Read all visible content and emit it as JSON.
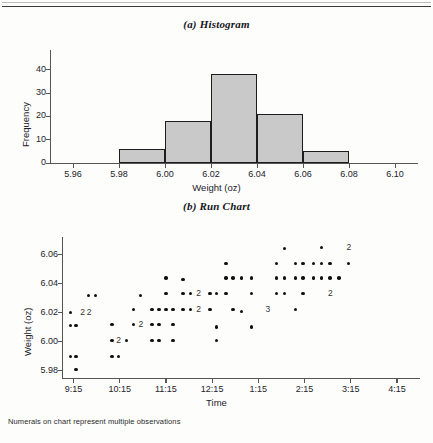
{
  "figure": {
    "title_a": "(a) Histogram",
    "title_b": "(b) Run Chart",
    "footnote": "Numerals on chart represent multiple observations"
  },
  "chart_data": [
    {
      "type": "bar",
      "title": "(a) Histogram",
      "xlabel": "Weight (oz)",
      "ylabel": "Frequency",
      "xlim": [
        5.95,
        6.11
      ],
      "ylim": [
        0,
        45
      ],
      "xticks": [
        "5.96",
        "5.98",
        "6.00",
        "6.02",
        "6.04",
        "6.06",
        "6.08",
        "6.10"
      ],
      "xtick_values": [
        5.96,
        5.98,
        6.0,
        6.02,
        6.04,
        6.06,
        6.08,
        6.1
      ],
      "yticks": [
        "0",
        "10",
        "20",
        "30",
        "40"
      ],
      "ytick_values": [
        0,
        10,
        20,
        30,
        40
      ],
      "grid": false,
      "legend": "none",
      "bin_edges": [
        5.98,
        6.0,
        6.02,
        6.04,
        6.06,
        6.08
      ],
      "categories": [
        "5.98-6.00",
        "6.00-6.02",
        "6.02-6.04",
        "6.04-6.06",
        "6.06-6.08"
      ],
      "values": [
        6,
        18,
        38,
        21,
        5
      ],
      "bar_fill": "#c9c9c9",
      "bar_edge": "#1d1d1d"
    },
    {
      "type": "scatter",
      "title": "(b) Run Chart",
      "xlabel": "Time",
      "ylabel": "Weight (oz)",
      "ylim": [
        5.975,
        6.068
      ],
      "yticks": [
        "5.98",
        "6.00",
        "6.02",
        "6.04",
        "6.06"
      ],
      "ytick_values": [
        5.98,
        6.0,
        6.02,
        6.04,
        6.06
      ],
      "xticks": [
        "9:15",
        "10:15",
        "11:15",
        "12:15",
        "1:15",
        "2:15",
        "3:15",
        "4:15"
      ],
      "xtick_values": [
        9.25,
        10.25,
        11.25,
        12.25,
        13.25,
        14.25,
        15.25,
        16.25
      ],
      "xlim": [
        9.0,
        16.75
      ],
      "grid": false,
      "legend": "none",
      "marker": "filled-circle",
      "marker_color": "#111111",
      "annotation_note": "Numerals on chart represent multiple observations",
      "points": [
        {
          "x": 9.18,
          "y": 6.02,
          "n": 1
        },
        {
          "x": 9.18,
          "y": 6.011,
          "n": 1
        },
        {
          "x": 9.18,
          "y": 5.99,
          "n": 1
        },
        {
          "x": 9.3,
          "y": 6.011,
          "n": 1
        },
        {
          "x": 9.3,
          "y": 5.99,
          "n": 1
        },
        {
          "x": 9.3,
          "y": 5.981,
          "n": 1
        },
        {
          "x": 9.44,
          "y": 6.02,
          "n": 2
        },
        {
          "x": 9.58,
          "y": 6.032,
          "n": 1
        },
        {
          "x": 9.58,
          "y": 6.02,
          "n": 2
        },
        {
          "x": 9.72,
          "y": 6.032,
          "n": 1
        },
        {
          "x": 10.08,
          "y": 6.012,
          "n": 1
        },
        {
          "x": 10.08,
          "y": 6.001,
          "n": 1
        },
        {
          "x": 10.08,
          "y": 5.99,
          "n": 1
        },
        {
          "x": 10.22,
          "y": 6.001,
          "n": 2
        },
        {
          "x": 10.22,
          "y": 5.99,
          "n": 1
        },
        {
          "x": 10.4,
          "y": 6.001,
          "n": 1
        },
        {
          "x": 10.55,
          "y": 6.022,
          "n": 1
        },
        {
          "x": 10.55,
          "y": 6.012,
          "n": 1
        },
        {
          "x": 10.7,
          "y": 6.032,
          "n": 1
        },
        {
          "x": 10.7,
          "y": 6.012,
          "n": 2
        },
        {
          "x": 10.95,
          "y": 6.022,
          "n": 1
        },
        {
          "x": 10.95,
          "y": 6.012,
          "n": 1
        },
        {
          "x": 10.95,
          "y": 6.001,
          "n": 1
        },
        {
          "x": 11.1,
          "y": 6.022,
          "n": 1
        },
        {
          "x": 11.1,
          "y": 6.012,
          "n": 1
        },
        {
          "x": 11.1,
          "y": 6.001,
          "n": 1
        },
        {
          "x": 11.25,
          "y": 6.044,
          "n": 1
        },
        {
          "x": 11.25,
          "y": 6.033,
          "n": 1
        },
        {
          "x": 11.25,
          "y": 6.022,
          "n": 1
        },
        {
          "x": 11.4,
          "y": 6.022,
          "n": 1
        },
        {
          "x": 11.4,
          "y": 6.012,
          "n": 1
        },
        {
          "x": 11.4,
          "y": 6.001,
          "n": 1
        },
        {
          "x": 11.62,
          "y": 6.043,
          "n": 1
        },
        {
          "x": 11.62,
          "y": 6.033,
          "n": 1
        },
        {
          "x": 11.62,
          "y": 6.022,
          "n": 1
        },
        {
          "x": 11.78,
          "y": 6.033,
          "n": 1
        },
        {
          "x": 11.78,
          "y": 6.022,
          "n": 1
        },
        {
          "x": 11.95,
          "y": 6.033,
          "n": 2
        },
        {
          "x": 11.95,
          "y": 6.022,
          "n": 2
        },
        {
          "x": 12.2,
          "y": 6.033,
          "n": 1
        },
        {
          "x": 12.2,
          "y": 6.022,
          "n": 1
        },
        {
          "x": 12.35,
          "y": 6.033,
          "n": 1
        },
        {
          "x": 12.35,
          "y": 6.01,
          "n": 1
        },
        {
          "x": 12.35,
          "y": 6.001,
          "n": 1
        },
        {
          "x": 12.55,
          "y": 6.054,
          "n": 1
        },
        {
          "x": 12.55,
          "y": 6.044,
          "n": 1
        },
        {
          "x": 12.55,
          "y": 6.033,
          "n": 1
        },
        {
          "x": 12.7,
          "y": 6.044,
          "n": 1
        },
        {
          "x": 12.7,
          "y": 6.022,
          "n": 1
        },
        {
          "x": 12.88,
          "y": 6.044,
          "n": 1
        },
        {
          "x": 12.88,
          "y": 6.021,
          "n": 1
        },
        {
          "x": 13.1,
          "y": 6.044,
          "n": 1
        },
        {
          "x": 13.1,
          "y": 6.033,
          "n": 1
        },
        {
          "x": 13.1,
          "y": 6.01,
          "n": 1
        },
        {
          "x": 13.45,
          "y": 6.022,
          "n": 3
        },
        {
          "x": 13.65,
          "y": 6.054,
          "n": 1
        },
        {
          "x": 13.65,
          "y": 6.044,
          "n": 1
        },
        {
          "x": 13.65,
          "y": 6.033,
          "n": 1
        },
        {
          "x": 13.82,
          "y": 6.064,
          "n": 1
        },
        {
          "x": 13.82,
          "y": 6.044,
          "n": 1
        },
        {
          "x": 13.82,
          "y": 6.033,
          "n": 1
        },
        {
          "x": 14.05,
          "y": 6.054,
          "n": 1
        },
        {
          "x": 14.05,
          "y": 6.044,
          "n": 1
        },
        {
          "x": 14.05,
          "y": 6.022,
          "n": 1
        },
        {
          "x": 14.22,
          "y": 6.054,
          "n": 1
        },
        {
          "x": 14.22,
          "y": 6.044,
          "n": 1
        },
        {
          "x": 14.22,
          "y": 6.033,
          "n": 1
        },
        {
          "x": 14.45,
          "y": 6.054,
          "n": 1
        },
        {
          "x": 14.45,
          "y": 6.044,
          "n": 1
        },
        {
          "x": 14.62,
          "y": 6.065,
          "n": 1
        },
        {
          "x": 14.62,
          "y": 6.054,
          "n": 1
        },
        {
          "x": 14.62,
          "y": 6.044,
          "n": 1
        },
        {
          "x": 14.8,
          "y": 6.054,
          "n": 1
        },
        {
          "x": 14.8,
          "y": 6.044,
          "n": 1
        },
        {
          "x": 14.8,
          "y": 6.033,
          "n": 2
        },
        {
          "x": 15.0,
          "y": 6.044,
          "n": 1
        },
        {
          "x": 15.2,
          "y": 6.065,
          "n": 2
        },
        {
          "x": 15.2,
          "y": 6.054,
          "n": 1
        }
      ]
    }
  ]
}
